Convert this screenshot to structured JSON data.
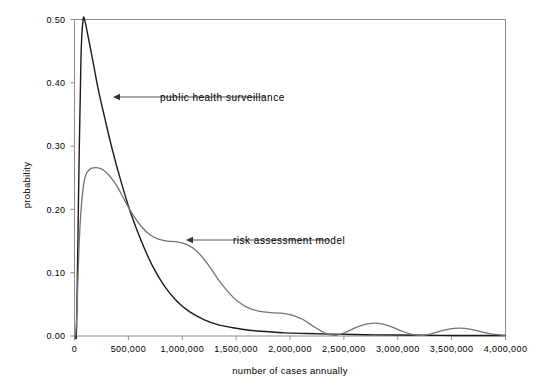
{
  "chart_data": {
    "type": "line",
    "title": "",
    "xlabel": "number of cases annually",
    "ylabel": "probability",
    "xlim": [
      0,
      4000000
    ],
    "ylim": [
      0,
      0.5
    ],
    "grid": false,
    "legend_position": "none",
    "x_tick_labels": [
      "0",
      "500,000",
      "1,000,000",
      "1,500,000",
      "2,000,000",
      "2,500,000",
      "3,000,000",
      "3,500,000",
      "4,000,000"
    ],
    "x_tick_values": [
      0,
      500000,
      1000000,
      1500000,
      2000000,
      2500000,
      3000000,
      3500000,
      4000000
    ],
    "y_tick_labels": [
      "0.00",
      "0.10",
      "0.20",
      "0.30",
      "0.40",
      "0.50"
    ],
    "y_tick_values": [
      0,
      0.1,
      0.2,
      0.3,
      0.4,
      0.5
    ],
    "series": [
      {
        "name": "public health surveillance",
        "color": "#1a1a1a",
        "width": 1.4,
        "x": [
          20000,
          40000,
          60000,
          80000,
          100000,
          130000,
          170000,
          220000,
          280000,
          350000,
          430000,
          520000,
          620000,
          720000,
          830000,
          950000,
          1070000,
          1200000,
          1330000,
          1470000,
          1620000,
          1780000,
          1950000,
          2150000,
          2400000,
          2700000,
          3000000,
          3400000,
          3800000,
          4000000
        ],
        "y": [
          0.02,
          0.25,
          0.44,
          0.5,
          0.495,
          0.47,
          0.435,
          0.39,
          0.345,
          0.295,
          0.245,
          0.195,
          0.15,
          0.112,
          0.08,
          0.055,
          0.038,
          0.026,
          0.018,
          0.013,
          0.009,
          0.007,
          0.005,
          0.004,
          0.003,
          0.002,
          0.0015,
          0.001,
          0.0008,
          0.0008
        ]
      },
      {
        "name": "risk assessment model",
        "color": "#737373",
        "width": 1.3,
        "x": [
          20000,
          50000,
          90000,
          140000,
          200000,
          260000,
          320000,
          390000,
          460000,
          540000,
          620000,
          700000,
          780000,
          860000,
          940000,
          1020000,
          1100000,
          1180000,
          1260000,
          1340000,
          1430000,
          1520000,
          1620000,
          1720000,
          1820000,
          1920000,
          2020000,
          2120000,
          2220000,
          2320000,
          2420000,
          2520000,
          2620000,
          2720000,
          2820000,
          2920000,
          3020000,
          3120000,
          3220000,
          3320000,
          3420000,
          3520000,
          3620000,
          3720000,
          3820000,
          3920000,
          4000000
        ],
        "y": [
          0.03,
          0.17,
          0.245,
          0.263,
          0.266,
          0.263,
          0.254,
          0.238,
          0.216,
          0.192,
          0.173,
          0.16,
          0.153,
          0.15,
          0.149,
          0.146,
          0.139,
          0.126,
          0.108,
          0.088,
          0.069,
          0.054,
          0.044,
          0.039,
          0.037,
          0.036,
          0.033,
          0.026,
          0.015,
          0.005,
          0.001,
          0.006,
          0.014,
          0.019,
          0.02,
          0.016,
          0.009,
          0.003,
          0.001,
          0.004,
          0.009,
          0.012,
          0.012,
          0.009,
          0.005,
          0.002,
          0.001
        ]
      }
    ],
    "annotations": [
      {
        "label": "public health surveillance",
        "text_x": 160,
        "text_y": 101,
        "arrow_from_x": 266,
        "arrow_from_y": 97,
        "arrow_to_x": 113,
        "arrow_to_y": 97
      },
      {
        "label": "risk assessment model",
        "text_x": 233,
        "text_y": 244,
        "arrow_from_x": 330,
        "arrow_from_y": 240,
        "arrow_to_x": 186,
        "arrow_to_y": 240
      }
    ]
  }
}
